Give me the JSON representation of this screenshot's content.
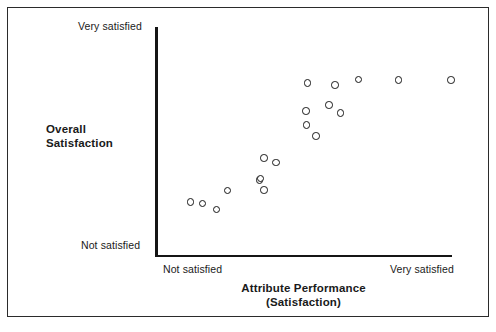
{
  "figure": {
    "width": 496,
    "height": 332,
    "background_color": "#ffffff",
    "frame_color": "#2b2b2b",
    "axis_color": "#151515",
    "marker_color": "#171717",
    "marker_fill": "#ffffff"
  },
  "chart_data": {
    "type": "scatter",
    "title": "",
    "xlabel": "Attribute Performance\n(Satisfaction)",
    "xlabel_line1": "Attribute Performance",
    "xlabel_line2": "(Satisfaction)",
    "ylabel": "Overall Satisfaction",
    "ylabel_line1": "Overall",
    "ylabel_line2": "Satisfaction",
    "x_tick_labels": [
      "Not satisfied",
      "Very satisfied"
    ],
    "y_tick_labels": [
      "Not satisfied",
      "Very satisfied"
    ],
    "xlim": [
      0,
      100
    ],
    "ylim": [
      0,
      100
    ],
    "grid": false,
    "legend": null,
    "marker": "open-circle",
    "n_points": 19,
    "points": [
      {
        "x": 12.0,
        "y": 23.3
      },
      {
        "x": 15.9,
        "y": 22.6
      },
      {
        "x": 20.8,
        "y": 20.2
      },
      {
        "x": 24.3,
        "y": 28.3
      },
      {
        "x": 35.0,
        "y": 32.6
      },
      {
        "x": 36.6,
        "y": 28.3
      },
      {
        "x": 37.0,
        "y": 42.2
      },
      {
        "x": 41.0,
        "y": 40.4
      },
      {
        "x": 35.7,
        "y": 33.5
      },
      {
        "x": 51.1,
        "y": 56.5
      },
      {
        "x": 54.3,
        "y": 51.7
      },
      {
        "x": 50.8,
        "y": 62.2
      },
      {
        "x": 58.5,
        "y": 64.8
      },
      {
        "x": 62.3,
        "y": 61.3
      },
      {
        "x": 51.2,
        "y": 74.8
      },
      {
        "x": 60.5,
        "y": 73.9
      },
      {
        "x": 68.4,
        "y": 76.5
      },
      {
        "x": 81.9,
        "y": 76.1
      },
      {
        "x": 99.9,
        "y": 76.1
      }
    ],
    "pixel_points": [
      {
        "px": 190.7,
        "py": 202.0
      },
      {
        "px": 202.3,
        "py": 203.7
      },
      {
        "px": 216.7,
        "py": 209.3
      },
      {
        "px": 227.3,
        "py": 190.5
      },
      {
        "px": 259.3,
        "py": 180.0
      },
      {
        "px": 264.0,
        "py": 190.0
      },
      {
        "px": 264.0,
        "py": 158.0
      },
      {
        "px": 276.0,
        "py": 162.3
      },
      {
        "px": 260.7,
        "py": 178.3
      },
      {
        "px": 306.7,
        "py": 125.0
      },
      {
        "px": 316.0,
        "py": 136.0
      },
      {
        "px": 306.0,
        "py": 111.2
      },
      {
        "px": 329.0,
        "py": 105.2
      },
      {
        "px": 340.3,
        "py": 113.2
      },
      {
        "px": 307.7,
        "py": 83.0
      },
      {
        "px": 335.0,
        "py": 85.0
      },
      {
        "px": 358.3,
        "py": 79.5
      },
      {
        "px": 398.3,
        "py": 80.0
      },
      {
        "px": 451.0,
        "py": 80.0
      }
    ]
  },
  "axes": {
    "y_top_label": "Very satisfied",
    "y_bottom_label": "Not satisfied",
    "y_title_line1": "Overall",
    "y_title_line2": "Satisfaction",
    "x_left_label": "Not satisfied",
    "x_right_label": "Very satisfied",
    "x_title_line1": "Attribute Performance",
    "x_title_line2": "(Satisfaction)"
  }
}
